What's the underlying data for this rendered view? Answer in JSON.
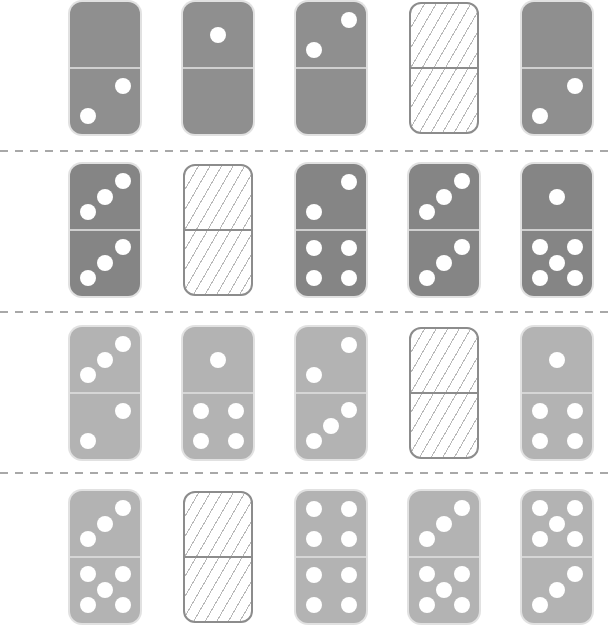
{
  "puzzle": {
    "rows": [
      {
        "shade": "#8f8f8f",
        "dominoes": [
          {
            "top": 0,
            "bottom": 2,
            "missing": false
          },
          {
            "top": 1,
            "bottom": 0,
            "missing": false
          },
          {
            "top": 2,
            "bottom": 0,
            "missing": false
          },
          {
            "top": null,
            "bottom": null,
            "missing": true
          },
          {
            "top": 0,
            "bottom": 2,
            "missing": false
          }
        ]
      },
      {
        "shade": "#858585",
        "dominoes": [
          {
            "top": 3,
            "bottom": 3,
            "missing": false
          },
          {
            "top": null,
            "bottom": null,
            "missing": true
          },
          {
            "top": 2,
            "bottom": 4,
            "missing": false
          },
          {
            "top": 3,
            "bottom": 3,
            "missing": false
          },
          {
            "top": 1,
            "bottom": 5,
            "missing": false
          }
        ]
      },
      {
        "shade": "#b3b3b3",
        "dominoes": [
          {
            "top": 3,
            "bottom": 2,
            "missing": false
          },
          {
            "top": 1,
            "bottom": 4,
            "missing": false
          },
          {
            "top": 2,
            "bottom": 3,
            "missing": false
          },
          {
            "top": null,
            "bottom": null,
            "missing": true
          },
          {
            "top": 1,
            "bottom": 4,
            "missing": false
          }
        ]
      },
      {
        "shade": "#b3b3b3",
        "dominoes": [
          {
            "top": 3,
            "bottom": 5,
            "missing": false
          },
          {
            "top": null,
            "bottom": null,
            "missing": true
          },
          {
            "top": 4,
            "bottom": 4,
            "missing": false
          },
          {
            "top": 3,
            "bottom": 5,
            "missing": false
          },
          {
            "top": 5,
            "bottom": 3,
            "missing": false
          }
        ]
      }
    ],
    "colors": {
      "pip": "#ffffff",
      "blank_border": "#8c8c8c",
      "separator": "#a8a8a8"
    }
  }
}
